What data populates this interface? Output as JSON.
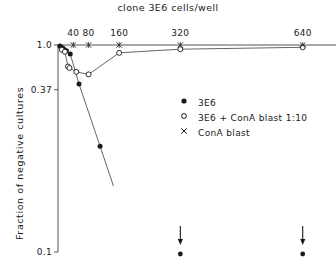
{
  "chart_data": {
    "type": "scatter",
    "title": "clone 3E6 cells/well",
    "xlabel": "clone 3E6 cells/well",
    "ylabel": "Fraction of negative cultures",
    "xscale": "linear",
    "yscale": "log",
    "xlim": [
      0,
      680
    ],
    "ylim": [
      0.01,
      1.0
    ],
    "grid": false,
    "axis_position": {
      "x_axis": "top",
      "y_axis": "left"
    },
    "legend_position": "center-right",
    "xticks": [
      40,
      80,
      160,
      320,
      640
    ],
    "xtick_labels": [
      "40",
      "80",
      "160",
      "320",
      "640"
    ],
    "yticks": [
      1.0,
      0.37,
      0.01
    ],
    "ytick_labels": [
      "1.0",
      "0.37",
      "0.1"
    ],
    "series": [
      {
        "name": "3E6",
        "marker": "filled-circle",
        "points": [
          {
            "x": 5,
            "y": 0.98
          },
          {
            "x": 9,
            "y": 0.95
          },
          {
            "x": 13,
            "y": 0.93
          },
          {
            "x": 17,
            "y": 0.9
          },
          {
            "x": 22,
            "y": 0.88
          },
          {
            "x": 32,
            "y": 0.82
          },
          {
            "x": 55,
            "y": 0.42
          },
          {
            "x": 110,
            "y": 0.105
          }
        ]
      },
      {
        "name": "3E6 + ConA blast 1:10",
        "marker": "open-circle",
        "points": [
          {
            "x": 10,
            "y": 0.9
          },
          {
            "x": 18,
            "y": 0.86
          },
          {
            "x": 26,
            "y": 0.62
          },
          {
            "x": 30,
            "y": 0.6
          },
          {
            "x": 48,
            "y": 0.55
          },
          {
            "x": 80,
            "y": 0.52
          },
          {
            "x": 160,
            "y": 0.84
          },
          {
            "x": 320,
            "y": 0.91
          },
          {
            "x": 640,
            "y": 0.95
          }
        ]
      },
      {
        "name": "ConA blast",
        "marker": "cross",
        "points": [
          {
            "x": 40,
            "y": 1.0
          },
          {
            "x": 80,
            "y": 1.0
          },
          {
            "x": 160,
            "y": 1.0
          },
          {
            "x": 320,
            "y": 1.0
          },
          {
            "x": 640,
            "y": 1.0
          }
        ]
      }
    ],
    "annotations": [
      {
        "type": "down-arrow-with-dot",
        "x": 320,
        "note": "below-axis marker"
      },
      {
        "type": "down-arrow-with-dot",
        "x": 640,
        "note": "below-axis marker"
      }
    ]
  },
  "legend": {
    "entries": [
      {
        "label": "3E6",
        "marker": "filled-circle"
      },
      {
        "label": "3E6 + ConA blast 1:10",
        "marker": "open-circle"
      },
      {
        "label": "ConA blast",
        "marker": "cross"
      }
    ]
  },
  "axes": {
    "title": "clone 3E6 cells/well",
    "y_title": "Fraction of negative cultures",
    "x_labels": [
      "40",
      "80",
      "160",
      "320",
      "640"
    ],
    "y_labels": [
      "1.0",
      "0.37",
      "0.1"
    ]
  },
  "colors": {
    "ink": "#1a1a1a",
    "line": "#555555",
    "background": "#ffffff"
  }
}
